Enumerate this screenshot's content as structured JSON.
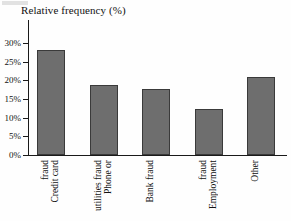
{
  "chart_data": {
    "type": "bar",
    "title": "Relative frequency (%)",
    "xlabel": "",
    "ylabel": "Relative frequency (%)",
    "categories": [
      "Credit card fraud",
      "Phone or utilities fraud",
      "Bank fraud",
      "Employment fraud",
      "Other"
    ],
    "category_lines": [
      [
        "Credit card",
        "fraud"
      ],
      [
        "Phone or",
        "utilities fraud"
      ],
      [
        "Bank fraud"
      ],
      [
        "Employment",
        "fraud"
      ],
      [
        "Other"
      ]
    ],
    "values": [
      28,
      18.8,
      17.7,
      12.3,
      21
    ],
    "value_labels": [
      "28%",
      "18.8%",
      "17.7%",
      "12.3%",
      "21%"
    ],
    "ylim": [
      0,
      32
    ],
    "yticks": [
      0,
      5,
      10,
      15,
      20,
      25,
      30
    ],
    "ytick_labels": [
      "0%",
      "5%",
      "10%",
      "15%",
      "20%",
      "25%",
      "30%"
    ],
    "grid": false,
    "legend": false,
    "bar_color": "#6e6e6e",
    "bar_edge_color": "#3a3a3a",
    "axis_color": "#1a1a1a"
  }
}
